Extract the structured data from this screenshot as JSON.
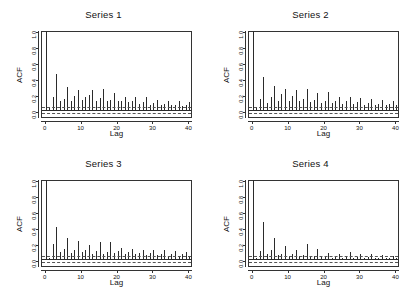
{
  "figure": {
    "background": "#ffffff",
    "bar_color": "#2b2b2b",
    "axis_color": "#333333"
  },
  "chart_data": [
    {
      "type": "bar",
      "title": "Series 1",
      "xlabel": "Lag",
      "ylabel": "ACF",
      "xlim": [
        -1,
        41
      ],
      "ylim": [
        -0.06,
        1.0
      ],
      "yticks": [
        "0.0",
        "0.2",
        "0.4",
        "0.6",
        "0.8",
        "1.0"
      ],
      "ytick_values": [
        0.0,
        0.2,
        0.4,
        0.6,
        0.8,
        1.0
      ],
      "xticks": [
        "0",
        "10",
        "20",
        "30",
        "40"
      ],
      "xtick_values": [
        0,
        10,
        20,
        30,
        40
      ],
      "grid": false,
      "legend": "none",
      "confidence_band": [
        -0.045,
        0.045
      ],
      "x": [
        0,
        1,
        2,
        3,
        4,
        5,
        6,
        7,
        8,
        9,
        10,
        11,
        12,
        13,
        14,
        15,
        16,
        17,
        18,
        19,
        20,
        21,
        22,
        23,
        24,
        25,
        26,
        27,
        28,
        29,
        30,
        31,
        32,
        33,
        34,
        35,
        36,
        37,
        38,
        39,
        40
      ],
      "values": [
        1.0,
        0.05,
        0.17,
        0.46,
        0.12,
        0.15,
        0.3,
        0.13,
        0.19,
        0.26,
        0.14,
        0.17,
        0.2,
        0.26,
        0.13,
        0.16,
        0.27,
        0.12,
        0.14,
        0.22,
        0.12,
        0.13,
        0.17,
        0.11,
        0.12,
        0.18,
        0.09,
        0.11,
        0.17,
        0.08,
        0.1,
        0.14,
        0.08,
        0.09,
        0.13,
        0.07,
        0.08,
        0.12,
        0.06,
        0.07,
        0.11
      ]
    },
    {
      "type": "bar",
      "title": "Series 2",
      "xlabel": "Lag",
      "ylabel": "ACF",
      "xlim": [
        -1,
        41
      ],
      "ylim": [
        -0.06,
        1.0
      ],
      "yticks": [
        "0.0",
        "0.2",
        "0.4",
        "0.6",
        "0.8",
        "1.0"
      ],
      "ytick_values": [
        0.0,
        0.2,
        0.4,
        0.6,
        0.8,
        1.0
      ],
      "xticks": [
        "0",
        "10",
        "20",
        "30",
        "40"
      ],
      "xtick_values": [
        0,
        10,
        20,
        30,
        40
      ],
      "grid": false,
      "legend": "none",
      "confidence_band": [
        -0.045,
        0.045
      ],
      "x": [
        0,
        1,
        2,
        3,
        4,
        5,
        6,
        7,
        8,
        9,
        10,
        11,
        12,
        13,
        14,
        15,
        16,
        17,
        18,
        19,
        20,
        21,
        22,
        23,
        24,
        25,
        26,
        27,
        28,
        29,
        30,
        31,
        32,
        33,
        34,
        35,
        36,
        37,
        38,
        39,
        40
      ],
      "values": [
        1.0,
        0.04,
        0.15,
        0.43,
        0.1,
        0.17,
        0.31,
        0.12,
        0.21,
        0.27,
        0.13,
        0.19,
        0.26,
        0.12,
        0.15,
        0.27,
        0.11,
        0.14,
        0.22,
        0.1,
        0.13,
        0.24,
        0.1,
        0.12,
        0.18,
        0.09,
        0.12,
        0.17,
        0.09,
        0.11,
        0.16,
        0.08,
        0.1,
        0.15,
        0.08,
        0.09,
        0.14,
        0.07,
        0.09,
        0.12,
        0.07
      ]
    },
    {
      "type": "bar",
      "title": "Series 3",
      "xlabel": "Lag",
      "ylabel": "ACF",
      "xlim": [
        -1,
        41
      ],
      "ylim": [
        -0.06,
        1.0
      ],
      "yticks": [
        "0.0",
        "0.2",
        "0.4",
        "0.6",
        "0.8",
        "1.0"
      ],
      "ytick_values": [
        0.0,
        0.2,
        0.4,
        0.6,
        0.8,
        1.0
      ],
      "xticks": [
        "0",
        "10",
        "20",
        "30",
        "40"
      ],
      "xtick_values": [
        0,
        10,
        20,
        30,
        40
      ],
      "grid": false,
      "legend": "none",
      "confidence_band": [
        -0.045,
        0.045
      ],
      "x": [
        0,
        1,
        2,
        3,
        4,
        5,
        6,
        7,
        8,
        9,
        10,
        11,
        12,
        13,
        14,
        15,
        16,
        17,
        18,
        19,
        20,
        21,
        22,
        23,
        24,
        25,
        26,
        27,
        28,
        29,
        30,
        31,
        32,
        33,
        34,
        35,
        36,
        37,
        38,
        39,
        40
      ],
      "values": [
        1.0,
        0.03,
        0.2,
        0.41,
        0.1,
        0.14,
        0.27,
        0.09,
        0.12,
        0.24,
        0.1,
        0.13,
        0.19,
        0.08,
        0.11,
        0.22,
        0.08,
        0.1,
        0.23,
        0.09,
        0.11,
        0.15,
        0.07,
        0.1,
        0.14,
        0.07,
        0.09,
        0.13,
        0.06,
        0.09,
        0.13,
        0.06,
        0.08,
        0.12,
        0.05,
        0.08,
        0.11,
        0.05,
        0.07,
        0.1,
        0.05
      ]
    },
    {
      "type": "bar",
      "title": "Series 4",
      "xlabel": "Lag",
      "ylabel": "ACF",
      "xlim": [
        -1,
        41
      ],
      "ylim": [
        -0.06,
        1.0
      ],
      "yticks": [
        "0.0",
        "0.2",
        "0.4",
        "0.6",
        "0.8",
        "1.0"
      ],
      "ytick_values": [
        0.0,
        0.2,
        0.4,
        0.6,
        0.8,
        1.0
      ],
      "xticks": [
        "0",
        "10",
        "20",
        "30",
        "40"
      ],
      "xtick_values": [
        0,
        10,
        20,
        30,
        40
      ],
      "grid": false,
      "legend": "none",
      "confidence_band": [
        -0.045,
        0.045
      ],
      "x": [
        0,
        1,
        2,
        3,
        4,
        5,
        6,
        7,
        8,
        9,
        10,
        11,
        12,
        13,
        14,
        15,
        16,
        17,
        18,
        19,
        20,
        21,
        22,
        23,
        24,
        25,
        26,
        27,
        28,
        29,
        30,
        31,
        32,
        33,
        34,
        35,
        36,
        37,
        38,
        39,
        40
      ],
      "values": [
        1.0,
        0.02,
        0.11,
        0.47,
        0.07,
        0.13,
        0.28,
        0.06,
        0.08,
        0.18,
        0.05,
        0.07,
        0.13,
        0.05,
        0.06,
        0.2,
        0.04,
        0.05,
        0.14,
        0.04,
        0.05,
        0.09,
        0.03,
        0.05,
        0.08,
        0.03,
        0.04,
        0.1,
        0.03,
        0.04,
        0.07,
        0.03,
        0.04,
        0.07,
        0.02,
        0.03,
        0.06,
        0.02,
        0.03,
        0.05,
        0.02
      ]
    }
  ]
}
